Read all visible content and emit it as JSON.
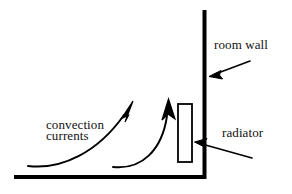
{
  "figure": {
    "kind": "line-diagram",
    "background_color": "#ffffff",
    "ink_color": "#000000"
  },
  "labels": {
    "room_wall": "room wall",
    "radiator": "radiator",
    "convection_line1": "convection",
    "convection_line2": "currents"
  },
  "geometry": {
    "floor": {
      "x1": 14,
      "y1": 177,
      "x2": 205,
      "y2": 177,
      "thickness": 4
    },
    "wall": {
      "x1": 204,
      "y1": 10,
      "x2": 204,
      "y2": 179,
      "thickness": 4
    },
    "radiator_rect": {
      "x": 178,
      "y": 104,
      "width": 14,
      "height": 58,
      "stroke": 2,
      "fill": "#ffffff"
    },
    "convection_arrow_left": {
      "start_x": 28,
      "start_y": 166,
      "end_x": 133,
      "end_y": 104,
      "head_angle_deg": 25
    },
    "convection_arrow_right": {
      "start_x": 113,
      "start_y": 167,
      "end_x": 168,
      "end_y": 102,
      "head_angle_deg": 5
    },
    "pointer_room_wall": {
      "tail_x": 250,
      "tail_y": 61,
      "tip_x": 210,
      "tip_y": 76
    },
    "pointer_radiator": {
      "tail_x": 252,
      "tail_y": 158,
      "tip_x": 195,
      "tip_y": 142
    }
  }
}
